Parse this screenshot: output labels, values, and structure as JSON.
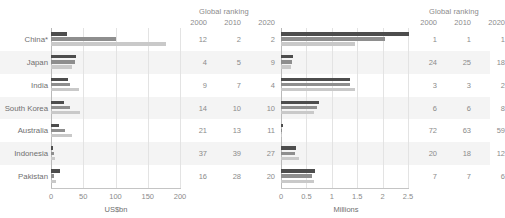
{
  "chart_data": [
    {
      "type": "bar",
      "title": "",
      "xlabel": "US$bn",
      "ylabel": "",
      "orientation": "horizontal",
      "grouped_by": "country",
      "grid": true,
      "legend_position": "none",
      "xlim": [
        0,
        200
      ],
      "xticks": [
        "0",
        "50",
        "100",
        "150",
        "200"
      ],
      "xtick_values": [
        0,
        50,
        100,
        150,
        200
      ],
      "categories": [
        "China*",
        "Japan",
        "India",
        "South Korea",
        "Australia",
        "Indonesia",
        "Pakistan"
      ],
      "series": [
        {
          "name": "2000",
          "color": "#4d4d4d",
          "values": [
            25,
            38,
            27,
            20,
            12,
            3,
            14
          ]
        },
        {
          "name": "2010",
          "color": "#8e8e8e",
          "values": [
            100,
            37,
            30,
            30,
            22,
            4,
            5
          ]
        },
        {
          "name": "2020",
          "color": "#c9c9c9",
          "values": [
            178,
            32,
            43,
            45,
            32,
            6,
            7
          ]
        }
      ],
      "ranking_header": "Global ranking",
      "ranking_years": [
        "2000",
        "2010",
        "2020"
      ],
      "ranking_rows": [
        [
          "12",
          "2",
          "2"
        ],
        [
          "4",
          "5",
          "9"
        ],
        [
          "9",
          "7",
          "4"
        ],
        [
          "14",
          "10",
          "10"
        ],
        [
          "21",
          "13",
          "11"
        ],
        [
          "37",
          "39",
          "27"
        ],
        [
          "16",
          "28",
          "20"
        ]
      ]
    },
    {
      "type": "bar",
      "title": "",
      "xlabel": "Millions",
      "ylabel": "",
      "orientation": "horizontal",
      "grouped_by": "country",
      "grid": true,
      "legend_position": "none",
      "xlim": [
        0,
        2.5
      ],
      "xticks": [
        "0",
        "0.5",
        "1",
        "1.5",
        "2",
        "2.5"
      ],
      "xtick_values": [
        0,
        0.5,
        1,
        1.5,
        2,
        2.5
      ],
      "categories": [
        "China*",
        "Japan",
        "India",
        "South Korea",
        "Australia",
        "Indonesia",
        "Pakistan"
      ],
      "series": [
        {
          "name": "2000",
          "color": "#4d4d4d",
          "values": [
            2.52,
            0.23,
            1.36,
            0.74,
            0.03,
            0.3,
            0.67
          ]
        },
        {
          "name": "2010",
          "color": "#8e8e8e",
          "values": [
            2.05,
            0.22,
            1.36,
            0.7,
            0.02,
            0.27,
            0.62
          ]
        },
        {
          "name": "2020",
          "color": "#c9c9c9",
          "values": [
            1.45,
            0.19,
            1.45,
            0.64,
            0.02,
            0.36,
            0.64
          ]
        }
      ],
      "ranking_header": "Global ranking",
      "ranking_years": [
        "2000",
        "2010",
        "2020"
      ],
      "ranking_rows": [
        [
          "1",
          "1",
          "1"
        ],
        [
          "24",
          "25",
          "18"
        ],
        [
          "3",
          "3",
          "2"
        ],
        [
          "6",
          "6",
          "8"
        ],
        [
          "72",
          "63",
          "59"
        ],
        [
          "20",
          "18",
          "12"
        ],
        [
          "7",
          "7",
          "6"
        ]
      ]
    }
  ],
  "colors": {
    "series_2000": "#4d4d4d",
    "series_2010": "#8e8e8e",
    "series_2020": "#c9c9c9",
    "band": "#f4f4f4",
    "grid": "#e3e3e3",
    "text": "#8b8b8b"
  }
}
